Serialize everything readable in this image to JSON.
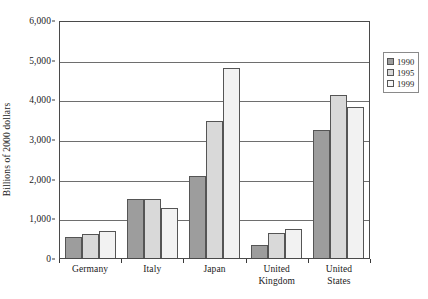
{
  "chart_data": {
    "type": "bar",
    "title": "",
    "xlabel": "",
    "ylabel": "Billions of 2000 dollars",
    "ylim": [
      0,
      6000
    ],
    "ytick_labels": [
      "0",
      "1,000",
      "2,000",
      "3,000",
      "4,000",
      "5,000",
      "6,000"
    ],
    "ytick_values": [
      0,
      1000,
      2000,
      3000,
      4000,
      5000,
      6000
    ],
    "grid": true,
    "legend_position": "outside-right-top",
    "categories": [
      "Germany",
      "Italy",
      "Japan",
      "United Kingdom",
      "United States"
    ],
    "category_label_lines": [
      [
        "Germany"
      ],
      [
        "Italy"
      ],
      [
        "Japan"
      ],
      [
        "United",
        "Kingdom"
      ],
      [
        "United",
        "States"
      ]
    ],
    "series": [
      {
        "name": "1990",
        "color": "#9d9d9d",
        "values": [
          520,
          1480,
          2070,
          330,
          3230
        ]
      },
      {
        "name": "1995",
        "color": "#d9d9d9",
        "values": [
          610,
          1480,
          3450,
          620,
          4120
        ]
      },
      {
        "name": "1999",
        "color": "#f2f2f2",
        "values": [
          690,
          1250,
          4780,
          720,
          3800
        ]
      }
    ]
  },
  "legend": {
    "items": [
      {
        "label": "1990"
      },
      {
        "label": "1995"
      },
      {
        "label": "1999"
      }
    ]
  }
}
